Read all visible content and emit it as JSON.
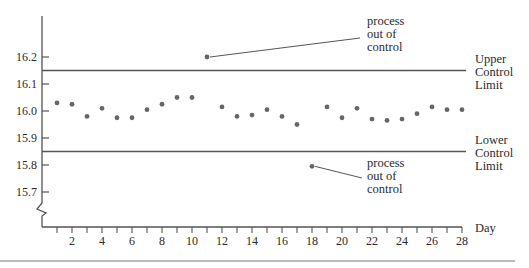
{
  "chart_data": {
    "type": "scatter",
    "title": "",
    "xlabel": "Day",
    "ylabel": "",
    "x": [
      1,
      2,
      3,
      4,
      5,
      6,
      7,
      8,
      9,
      10,
      11,
      12,
      13,
      14,
      15,
      16,
      17,
      18,
      19,
      20,
      21,
      22,
      23,
      24,
      25,
      26,
      27,
      28
    ],
    "series": [
      {
        "name": "daily measurement",
        "values": [
          16.03,
          16.025,
          15.98,
          16.01,
          15.975,
          15.975,
          16.005,
          16.025,
          16.05,
          16.05,
          16.2,
          16.015,
          15.98,
          15.985,
          16.005,
          15.98,
          15.95,
          15.795,
          16.015,
          15.975,
          16.01,
          15.97,
          15.965,
          15.97,
          15.99,
          16.015,
          16.005,
          16.005
        ]
      }
    ],
    "ylim": [
      15.6,
      16.3
    ],
    "xlim": [
      0,
      28
    ],
    "yticks": [
      15.7,
      15.8,
      15.9,
      16.0,
      16.1,
      16.2
    ],
    "ytick_labels": [
      "15.7",
      "15.8",
      "15.9",
      "16.0",
      "16.1",
      "16.2"
    ],
    "xticks": [
      1,
      2,
      3,
      4,
      5,
      6,
      7,
      8,
      9,
      10,
      11,
      12,
      13,
      14,
      15,
      16,
      17,
      18,
      19,
      20,
      21,
      22,
      23,
      24,
      25,
      26,
      27,
      28
    ],
    "xtick_labels": [
      "2",
      "4",
      "6",
      "8",
      "10",
      "12",
      "14",
      "16",
      "18",
      "20",
      "22",
      "24",
      "26",
      "28"
    ],
    "upper_control_limit": 16.15,
    "lower_control_limit": 15.85,
    "limit_labels": {
      "upper": [
        "Upper",
        "Control",
        "Limit"
      ],
      "lower": [
        "Lower",
        "Control",
        "Limit"
      ]
    },
    "annotations": [
      {
        "day": 11,
        "value": 16.2,
        "text": [
          "process",
          "out of",
          "control"
        ]
      },
      {
        "day": 18,
        "value": 15.795,
        "text": [
          "process",
          "out of",
          "control"
        ]
      }
    ],
    "axis_break": true,
    "grid": false,
    "legend": "none",
    "colors": {
      "axis": "#555555",
      "points": "#666666",
      "text": "#2b2b2b"
    }
  }
}
